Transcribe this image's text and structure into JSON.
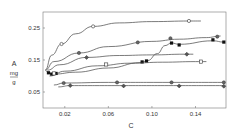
{
  "chart_data": {
    "type": "line",
    "title": "",
    "xlabel": "C",
    "ylabel": [
      "A",
      "mg",
      "g"
    ],
    "xlim": [
      0,
      0.168
    ],
    "ylim": [
      0,
      0.3
    ],
    "x_ticks": [
      0.02,
      0.06,
      0.1,
      0.14
    ],
    "x_tick_labels": [
      "0.02",
      "0.06",
      "0.10",
      "0.14"
    ],
    "y_ticks": [
      0.05,
      0.15,
      0.25
    ],
    "y_tick_labels": [
      "0.05",
      "0.15",
      "0.25"
    ],
    "grid": false,
    "legend": null,
    "series": [
      {
        "name": "curve-1",
        "marker": "open-circle",
        "x": [
          0.002,
          0.008,
          0.017,
          0.03,
          0.046,
          0.07,
          0.1,
          0.135,
          0.145
        ],
        "y": [
          0.118,
          0.165,
          0.2,
          0.232,
          0.255,
          0.266,
          0.27,
          0.272,
          0.272
        ],
        "points": [
          [
            0.017,
            0.2
          ],
          [
            0.046,
            0.255
          ],
          [
            0.134,
            0.272
          ]
        ]
      },
      {
        "name": "curve-2",
        "marker": "half-circle",
        "x": [
          0.002,
          0.01,
          0.033,
          0.06,
          0.1,
          0.125,
          0.15,
          0.163
        ],
        "y": [
          0.118,
          0.145,
          0.172,
          0.192,
          0.208,
          0.215,
          0.22,
          0.225
        ],
        "points": [
          [
            0.033,
            0.172
          ],
          [
            0.087,
            0.205
          ],
          [
            0.117,
            0.218
          ],
          [
            0.16,
            0.223
          ]
        ]
      },
      {
        "name": "curve-3",
        "marker": "filled-square",
        "x": [
          0.003,
          0.006,
          0.01,
          0.03,
          0.06,
          0.09,
          0.096,
          0.105,
          0.112,
          0.118,
          0.125,
          0.156,
          0.166
        ],
        "y": [
          0.115,
          0.108,
          0.106,
          0.112,
          0.125,
          0.142,
          0.148,
          0.17,
          0.195,
          0.203,
          0.199,
          0.21,
          0.206
        ],
        "points": [
          [
            0.005,
            0.11
          ],
          [
            0.008,
            0.106
          ],
          [
            0.012,
            0.108
          ],
          [
            0.091,
            0.144
          ],
          [
            0.095,
            0.147
          ],
          [
            0.118,
            0.203
          ],
          [
            0.125,
            0.197
          ],
          [
            0.156,
            0.213
          ],
          [
            0.166,
            0.206
          ]
        ]
      },
      {
        "name": "curve-4",
        "marker": "half-diamond",
        "x": [
          0.004,
          0.015,
          0.04,
          0.07,
          0.1,
          0.13,
          0.138
        ],
        "y": [
          0.118,
          0.135,
          0.158,
          0.164,
          0.166,
          0.168,
          0.168
        ],
        "points": [
          [
            0.04,
            0.158
          ],
          [
            0.132,
            0.168
          ]
        ]
      },
      {
        "name": "curve-5",
        "marker": "open-square",
        "x": [
          0.006,
          0.02,
          0.05,
          0.08,
          0.11,
          0.14,
          0.15
        ],
        "y": [
          0.1,
          0.115,
          0.132,
          0.14,
          0.143,
          0.145,
          0.145
        ],
        "points": [
          [
            0.01,
            0.108
          ],
          [
            0.058,
            0.136
          ],
          [
            0.145,
            0.145
          ]
        ]
      },
      {
        "name": "curve-6",
        "marker": "half-circle",
        "x": [
          0.01,
          0.019,
          0.06,
          0.11,
          0.165
        ],
        "y": [
          0.072,
          0.078,
          0.08,
          0.08,
          0.08
        ],
        "points": [
          [
            0.019,
            0.078
          ],
          [
            0.068,
            0.08
          ],
          [
            0.118,
            0.08
          ],
          [
            0.166,
            0.08
          ]
        ]
      },
      {
        "name": "curve-7",
        "marker": "half-diamond",
        "x": [
          0.014,
          0.025,
          0.07,
          0.12,
          0.166
        ],
        "y": [
          0.066,
          0.07,
          0.07,
          0.07,
          0.07
        ],
        "points": [
          [
            0.025,
            0.07
          ],
          [
            0.074,
            0.069
          ],
          [
            0.125,
            0.069
          ],
          [
            0.166,
            0.068
          ]
        ]
      }
    ]
  }
}
